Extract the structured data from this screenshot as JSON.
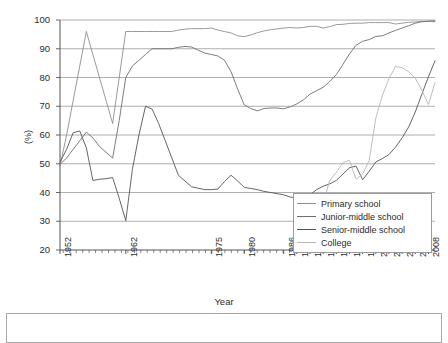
{
  "chart_data": {
    "type": "line",
    "title": "",
    "xlabel": "Year",
    "ylabel": "(%)",
    "ylim": [
      20,
      100
    ],
    "y_ticks": [
      20,
      30,
      40,
      50,
      60,
      70,
      80,
      90,
      100
    ],
    "grid": "horizontal",
    "legend_position": "lower-right-inside",
    "x_tick_labels": [
      "1952",
      "1962",
      "1975",
      "1980",
      "1986",
      "1988",
      "1990",
      "1992",
      "1994",
      "1996",
      "1998",
      "2000",
      "2002",
      "2004",
      "2006",
      "2008"
    ],
    "x_range": [
      1952,
      2009
    ],
    "series": [
      {
        "name": "Primary school",
        "color": "#8f8f8f",
        "x": [
          1952,
          1953,
          1954,
          1955,
          1956,
          1957,
          1958,
          1959,
          1960,
          1961,
          1962,
          1963,
          1964,
          1965,
          1966,
          1967,
          1968,
          1969,
          1970,
          1971,
          1972,
          1973,
          1974,
          1975,
          1976,
          1977,
          1978,
          1979,
          1980,
          1981,
          1982,
          1983,
          1984,
          1985,
          1986,
          1987,
          1988,
          1989,
          1990,
          1991,
          1992,
          1993,
          1994,
          1995,
          1996,
          1997,
          1998,
          1999,
          2000,
          2001,
          2002,
          2003,
          2004,
          2005,
          2006,
          2007,
          2008,
          2009
        ],
        "values": [
          49.2,
          60,
          72,
          84,
          96,
          88,
          80,
          72,
          64,
          80,
          96,
          96,
          96,
          96,
          96,
          96,
          96,
          96,
          96.5,
          96.8,
          97,
          97,
          97,
          97.2,
          96.5,
          96,
          95.5,
          94.5,
          94.2,
          94.8,
          95.6,
          96.2,
          96.6,
          96.9,
          97.2,
          97.4,
          97.2,
          97.4,
          97.8,
          97.8,
          97.2,
          97.7,
          98.4,
          98.5,
          98.8,
          98.9,
          98.9,
          99.1,
          99.1,
          99.1,
          99.1,
          98.6,
          98.9,
          99.2,
          99.3,
          99.5,
          99.5,
          99.4
        ]
      },
      {
        "name": "Junior-middle school",
        "color": "#6e6e6e",
        "x": [
          1952,
          1953,
          1954,
          1955,
          1956,
          1957,
          1958,
          1959,
          1960,
          1961,
          1962,
          1963,
          1964,
          1965,
          1966,
          1967,
          1968,
          1969,
          1970,
          1971,
          1972,
          1973,
          1974,
          1975,
          1976,
          1977,
          1978,
          1979,
          1980,
          1981,
          1982,
          1983,
          1984,
          1985,
          1986,
          1987,
          1988,
          1989,
          1990,
          1991,
          1992,
          1993,
          1994,
          1995,
          1996,
          1997,
          1998,
          1999,
          2000,
          2001,
          2002,
          2003,
          2004,
          2005,
          2006,
          2007,
          2008,
          2009
        ],
        "values": [
          49.8,
          52,
          55,
          58,
          61,
          59,
          56,
          54,
          52,
          65,
          80,
          84,
          86,
          88,
          90,
          90,
          90,
          90,
          90.5,
          90.8,
          90.6,
          89.5,
          88.5,
          88,
          87.5,
          86,
          82,
          76,
          70.5,
          69.2,
          68.4,
          69.2,
          69.4,
          69.4,
          69.1,
          69.8,
          70.8,
          72.2,
          74.2,
          75.4,
          76.6,
          78.6,
          81,
          84.5,
          88.2,
          91.2,
          92.6,
          93.2,
          94.3,
          94.5,
          95.5,
          96.4,
          97.2,
          98,
          98.9,
          99.4,
          99.6,
          99.7
        ]
      },
      {
        "name": "Senior-middle school",
        "color": "#555555",
        "x": [
          1952,
          1953,
          1954,
          1955,
          1956,
          1957,
          1958,
          1959,
          1960,
          1961,
          1962,
          1963,
          1964,
          1965,
          1966,
          1967,
          1968,
          1969,
          1970,
          1971,
          1972,
          1973,
          1974,
          1975,
          1976,
          1977,
          1978,
          1979,
          1980,
          1981,
          1982,
          1983,
          1984,
          1985,
          1986,
          1987,
          1988,
          1989,
          1990,
          1991,
          1992,
          1993,
          1994,
          1995,
          1996,
          1997,
          1998,
          1999,
          2000,
          2001,
          2002,
          2003,
          2004,
          2005,
          2006,
          2007,
          2008,
          2009
        ],
        "values": [
          50.6,
          55,
          60.8,
          61.4,
          55.6,
          44.2,
          44.6,
          44.8,
          45.2,
          38,
          30.2,
          48,
          60,
          70,
          69,
          64,
          58,
          52,
          46,
          44,
          42,
          41.5,
          41,
          41,
          41.2,
          43.8,
          46,
          44,
          41.8,
          41.4,
          41,
          40.4,
          40,
          39.6,
          39.2,
          38.4,
          38.2,
          38.6,
          39.2,
          41,
          42.2,
          43,
          44.2,
          46.4,
          48.6,
          49.2,
          44.4,
          47.4,
          50.6,
          51.8,
          53.2,
          55.8,
          59,
          62.8,
          68,
          74.2,
          80.2,
          85.8
        ]
      },
      {
        "name": "College",
        "color": "#b5b5b5",
        "x": [
          1990,
          1991,
          1992,
          1993,
          1994,
          1995,
          1996,
          1997,
          1998,
          1999,
          2000,
          2001,
          2002,
          2003,
          2004,
          2005,
          2006,
          2007,
          2008,
          2009
        ],
        "values": [
          27.5,
          29.4,
          36.4,
          44.2,
          47,
          50.4,
          51.2,
          44.6,
          46.4,
          51.2,
          65.8,
          73.8,
          79.6,
          83.8,
          83.4,
          82,
          79.8,
          75.6,
          70.6,
          78.2
        ]
      }
    ]
  },
  "legend": {
    "items": [
      {
        "label": "Primary school"
      },
      {
        "label": "Junior-middle school"
      },
      {
        "label": "Senior-middle school"
      },
      {
        "label": "College"
      }
    ]
  },
  "axes": {
    "y_title": "(%)",
    "x_title": "Year"
  },
  "colors": {
    "grid": "#9a9a9a",
    "axis": "#555555",
    "plot_background": "#ffffff"
  }
}
